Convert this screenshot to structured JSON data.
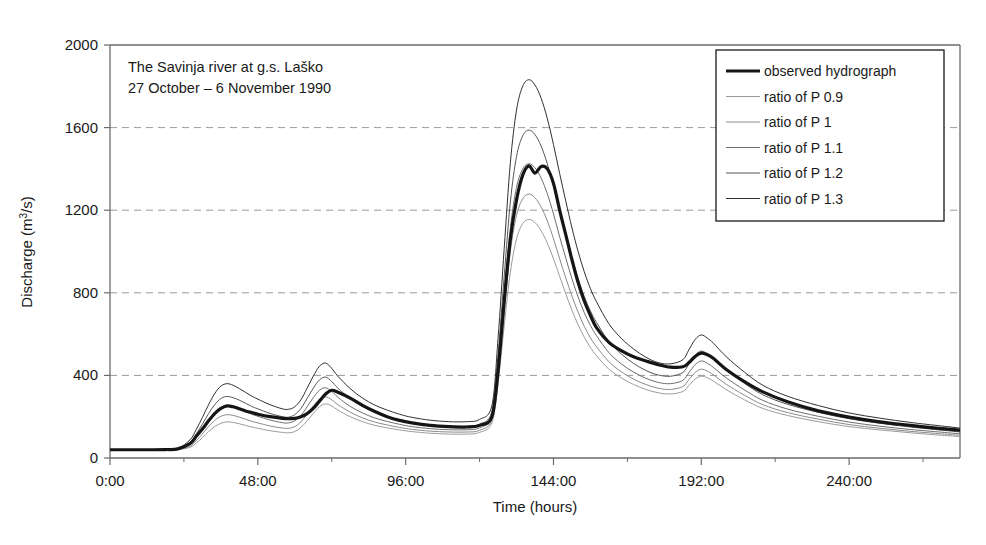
{
  "figure": {
    "width": 986,
    "height": 545,
    "background": "#ffffff",
    "frame_color": "#6b6b6b",
    "grid_color": "#9a9a9a"
  },
  "annotation": {
    "line1": "The Savinja river at g.s. Laško",
    "line2": "27 October – 6 November 1990"
  },
  "legend": {
    "position": "top-right",
    "border_color": "#1a1a1a",
    "background": "#ffffff",
    "entries": [
      {
        "label": "observed hydrograph",
        "color": "#151515",
        "width": 3.2
      },
      {
        "label": "ratio of P 0.9",
        "color": "#9b9b9b",
        "width": 1.0
      },
      {
        "label": "ratio of P 1",
        "color": "#8a8a8a",
        "width": 1.0
      },
      {
        "label": "ratio of P 1.1",
        "color": "#6d6d6d",
        "width": 1.0
      },
      {
        "label": "ratio of P 1.2",
        "color": "#555555",
        "width": 1.0
      },
      {
        "label": "ratio of P 1.3",
        "color": "#303030",
        "width": 1.0
      }
    ]
  },
  "chart_data": {
    "type": "line",
    "title": "",
    "xlabel": "Time (hours)",
    "ylabel": "Discharge (m3/s)",
    "ylabel_display": "Discharge (m³/s)",
    "xlim": [
      0,
      276
    ],
    "ylim": [
      0,
      2000
    ],
    "yticks": [
      0,
      400,
      800,
      1200,
      1600,
      2000
    ],
    "ytick_labels": [
      "0",
      "400",
      "800",
      "1200",
      "1600",
      "2000"
    ],
    "xticks": [
      0,
      48,
      96,
      144,
      192,
      240
    ],
    "xtick_labels": [
      "0:00",
      "48:00",
      "96:00",
      "144:00",
      "192:00",
      "240:00"
    ],
    "x_minor_ticks": [
      24,
      72,
      120,
      168,
      216,
      264
    ],
    "grid": "horizontal-dashed",
    "legend_position": "top-right",
    "x": [
      0,
      6,
      12,
      18,
      22,
      26,
      28,
      30,
      32,
      34,
      36,
      38,
      40,
      42,
      44,
      46,
      48,
      52,
      56,
      58,
      60,
      62,
      64,
      66,
      68,
      70,
      72,
      74,
      78,
      82,
      86,
      90,
      94,
      98,
      104,
      110,
      116,
      120,
      124,
      126,
      128,
      130,
      132,
      134,
      136,
      138,
      140,
      142,
      144,
      146,
      148,
      150,
      152,
      154,
      156,
      158,
      162,
      166,
      170,
      174,
      178,
      182,
      186,
      188,
      190,
      192,
      194,
      196,
      200,
      206,
      212,
      220,
      230,
      240,
      250,
      260,
      270,
      276
    ],
    "series": [
      {
        "name": "observed hydrograph",
        "color": "#151515",
        "width": 3.2,
        "values": [
          40,
          40,
          40,
          41,
          44,
          70,
          105,
          140,
          180,
          215,
          240,
          252,
          248,
          238,
          228,
          220,
          212,
          200,
          192,
          190,
          192,
          200,
          215,
          240,
          275,
          310,
          328,
          318,
          290,
          255,
          225,
          200,
          182,
          170,
          158,
          152,
          150,
          158,
          200,
          420,
          760,
          1060,
          1250,
          1370,
          1415,
          1380,
          1412,
          1400,
          1330,
          1200,
          1080,
          960,
          850,
          760,
          690,
          630,
          560,
          520,
          490,
          470,
          452,
          440,
          442,
          462,
          492,
          508,
          500,
          482,
          430,
          370,
          320,
          272,
          228,
          198,
          175,
          158,
          142,
          135
        ]
      },
      {
        "name": "ratio of P 0.9",
        "color": "#9b9b9b",
        "width": 1.0,
        "values": [
          38,
          38,
          38,
          38,
          40,
          52,
          72,
          98,
          128,
          152,
          168,
          175,
          172,
          166,
          158,
          150,
          144,
          132,
          124,
          122,
          128,
          148,
          180,
          215,
          248,
          262,
          252,
          232,
          200,
          176,
          158,
          146,
          136,
          128,
          120,
          116,
          116,
          124,
          170,
          360,
          640,
          900,
          1060,
          1135,
          1155,
          1140,
          1100,
          1040,
          965,
          880,
          795,
          715,
          645,
          585,
          535,
          495,
          430,
          388,
          356,
          332,
          316,
          310,
          322,
          352,
          382,
          396,
          388,
          372,
          332,
          282,
          240,
          206,
          176,
          152,
          136,
          122,
          110,
          104
        ]
      },
      {
        "name": "ratio of P 1",
        "color": "#8a8a8a",
        "width": 1.0,
        "values": [
          38,
          38,
          38,
          39,
          41,
          58,
          84,
          116,
          152,
          182,
          202,
          210,
          206,
          198,
          188,
          178,
          170,
          155,
          145,
          144,
          152,
          175,
          212,
          252,
          285,
          296,
          282,
          258,
          222,
          194,
          174,
          160,
          148,
          139,
          130,
          126,
          126,
          134,
          185,
          400,
          710,
          1000,
          1175,
          1255,
          1278,
          1260,
          1215,
          1148,
          1062,
          965,
          872,
          784,
          706,
          638,
          582,
          538,
          466,
          418,
          382,
          356,
          338,
          332,
          346,
          380,
          414,
          430,
          420,
          402,
          358,
          304,
          258,
          220,
          188,
          162,
          144,
          129,
          117,
          110
        ]
      },
      {
        "name": "ratio of P 1.1",
        "color": "#6d6d6d",
        "width": 1.0,
        "values": [
          39,
          39,
          39,
          40,
          42,
          66,
          98,
          138,
          182,
          218,
          242,
          252,
          247,
          237,
          224,
          212,
          202,
          184,
          171,
          170,
          180,
          206,
          248,
          292,
          328,
          340,
          322,
          294,
          250,
          218,
          194,
          177,
          163,
          152,
          142,
          137,
          137,
          146,
          202,
          445,
          790,
          1115,
          1310,
          1400,
          1425,
          1405,
          1355,
          1280,
          1182,
          1072,
          968,
          868,
          780,
          704,
          642,
          592,
          510,
          456,
          416,
          386,
          366,
          360,
          376,
          414,
          452,
          470,
          458,
          438,
          389,
          330,
          279,
          237,
          202,
          174,
          154,
          138,
          125,
          117
        ]
      },
      {
        "name": "ratio of P 1.2",
        "color": "#555555",
        "width": 1.0,
        "values": [
          40,
          40,
          40,
          41,
          44,
          76,
          116,
          164,
          215,
          258,
          288,
          298,
          292,
          280,
          265,
          250,
          238,
          216,
          200,
          198,
          210,
          240,
          288,
          338,
          378,
          392,
          370,
          338,
          288,
          249,
          221,
          201,
          184,
          172,
          160,
          154,
          154,
          164,
          224,
          500,
          880,
          1240,
          1460,
          1560,
          1588,
          1566,
          1510,
          1425,
          1316,
          1194,
          1078,
          966,
          868,
          782,
          712,
          656,
          564,
          504,
          458,
          424,
          402,
          396,
          414,
          456,
          498,
          518,
          504,
          482,
          428,
          362,
          306,
          260,
          221,
          190,
          168,
          150,
          135,
          126
        ]
      },
      {
        "name": "ratio of P 1.3",
        "color": "#303030",
        "width": 1.0,
        "values": [
          41,
          41,
          41,
          42,
          46,
          88,
          138,
          196,
          258,
          312,
          348,
          360,
          352,
          336,
          318,
          300,
          285,
          258,
          238,
          236,
          248,
          282,
          338,
          396,
          444,
          460,
          434,
          396,
          336,
          290,
          256,
          232,
          212,
          197,
          183,
          176,
          176,
          187,
          254,
          578,
          1015,
          1430,
          1685,
          1800,
          1832,
          1806,
          1742,
          1644,
          1518,
          1378,
          1244,
          1114,
          1000,
          902,
          820,
          756,
          650,
          580,
          528,
          488,
          462,
          456,
          476,
          525,
          574,
          596,
          580,
          555,
          492,
          416,
          352,
          299,
          254,
          218,
          193,
          172,
          155,
          145
        ]
      }
    ]
  }
}
